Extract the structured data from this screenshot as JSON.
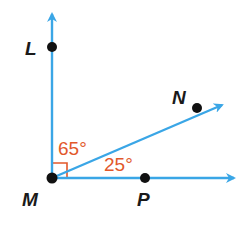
{
  "colors": {
    "ray": "#3aa6e6",
    "point": "#111111",
    "label": "#1a1a1a",
    "angle": "#e2582b",
    "background": "#ffffff"
  },
  "vertex": {
    "name": "M",
    "x": 52,
    "y": 178
  },
  "rays": [
    {
      "id": "ML",
      "to": {
        "x": 52,
        "y": 14
      }
    },
    {
      "id": "MN",
      "to": {
        "x": 222,
        "y": 105
      }
    },
    {
      "id": "MP",
      "to": {
        "x": 234,
        "y": 178
      }
    }
  ],
  "points": [
    {
      "name": "L",
      "x": 52,
      "y": 47,
      "label": "L",
      "lx": 25,
      "ly": 55
    },
    {
      "name": "M",
      "x": 52,
      "y": 178,
      "label": "M",
      "lx": 23,
      "ly": 206
    },
    {
      "name": "N",
      "x": 197,
      "y": 108,
      "label": "N",
      "lx": 173,
      "ly": 103
    },
    {
      "name": "P",
      "x": 145,
      "y": 178,
      "label": "P",
      "lx": 137,
      "ly": 206
    }
  ],
  "angles": [
    {
      "between": "LMN",
      "label": "65°",
      "x": 59,
      "y": 155
    },
    {
      "between": "NMP",
      "label": "25°",
      "x": 105,
      "y": 170
    }
  ],
  "right_angle_marker": {
    "at": "M",
    "between": "LMP",
    "size": 15
  }
}
